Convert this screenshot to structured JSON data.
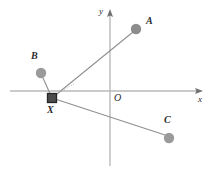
{
  "figure": {
    "type": "geometry-diagram",
    "width": 214,
    "height": 172,
    "background": "#ffffff"
  },
  "axes": {
    "x_label": "x",
    "y_label": "y",
    "origin_label": "O",
    "color": "#b9b9b9",
    "origin_px": {
      "x": 110,
      "y": 91
    },
    "x_axis": {
      "x1": 10,
      "y1": 91,
      "x2": 203,
      "y2": 91,
      "arrow": "right"
    },
    "y_axis": {
      "x1": 110,
      "y1": 166,
      "x2": 110,
      "y2": 10,
      "arrow": "up"
    },
    "x_label_px": {
      "x": 199,
      "y": 95
    },
    "y_label_px": {
      "x": 99,
      "y": 8
    },
    "origin_label_px": {
      "x": 114,
      "y": 93
    }
  },
  "marker": {
    "name": "X",
    "label": "X",
    "shape": "square",
    "fill": "#4d4d4d",
    "stroke": "#2b2b2b",
    "size": 9,
    "center_px": {
      "x": 52,
      "y": 98
    },
    "label_px": {
      "x": 48,
      "y": 106
    }
  },
  "points": [
    {
      "label": "A",
      "shape": "circle",
      "fill": "#8c8c8c",
      "radius": 5,
      "center_px": {
        "x": 136,
        "y": 29
      },
      "label_px": {
        "x": 146,
        "y": 21
      }
    },
    {
      "label": "B",
      "shape": "circle",
      "fill": "#9a9a9a",
      "radius": 5,
      "center_px": {
        "x": 41,
        "y": 73
      },
      "label_px": {
        "x": 31,
        "y": 56
      }
    },
    {
      "label": "C",
      "shape": "circle",
      "fill": "#9a9a9a",
      "radius": 5,
      "center_px": {
        "x": 169,
        "y": 138
      },
      "label_px": {
        "x": 164,
        "y": 120
      }
    }
  ],
  "connectors": [
    {
      "name": "segment-x-to-a",
      "from": "X",
      "to": "A",
      "x1": 52,
      "y1": 98,
      "x2": 133,
      "y2": 32,
      "style": "solid",
      "color": "#8f8f8f"
    },
    {
      "name": "segment-x-to-b",
      "from": "X",
      "to": "B",
      "x1": 52,
      "y1": 98,
      "x2": 43,
      "y2": 78,
      "style": "solid",
      "color": "#8f8f8f"
    },
    {
      "name": "segment-x-to-c",
      "from": "X",
      "to": "C",
      "x1": 52,
      "y1": 98,
      "x2": 165,
      "y2": 135,
      "style": "solid",
      "color": "#8f8f8f"
    },
    {
      "name": "segment-x-dashed-helper",
      "from": "X",
      "to": "origin-direction",
      "x1": 52,
      "y1": 98,
      "x2": 72,
      "y2": 85,
      "style": "dotted",
      "color": "#b0b0b0"
    }
  ]
}
